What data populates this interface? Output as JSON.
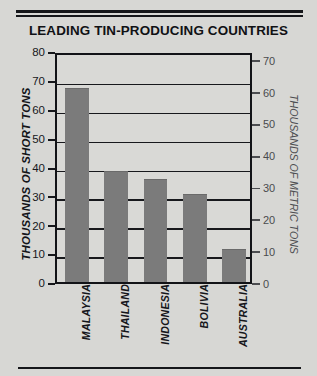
{
  "chart_data": {
    "type": "bar",
    "title": "LEADING TIN-PRODUCING COUNTRIES",
    "categories": [
      "MALAYSIA",
      "THAILAND",
      "INDONESIA",
      "BOLIVIA",
      "AUSTRALIA"
    ],
    "values": [
      67,
      38,
      35.5,
      30,
      11
    ],
    "xlabel": "",
    "ylabel": "THOUSANDS OF SHORT TONS",
    "ylim": [
      0,
      80
    ],
    "yticks": [
      0,
      10,
      20,
      30,
      40,
      50,
      60,
      70,
      80
    ],
    "secondary_axis": {
      "ylabel": "THOUSANDS OF METRIC TONS",
      "ylim": [
        0,
        72.6
      ],
      "yticks": [
        0,
        10,
        20,
        30,
        40,
        50,
        60,
        70
      ]
    },
    "grid": true,
    "legend": false,
    "bar_color": "#7b7b7b",
    "background_color": "#d7d7d4",
    "axis_color": "#15161a"
  }
}
